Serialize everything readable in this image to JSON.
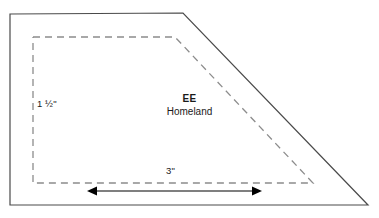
{
  "diagram": {
    "type": "technical-drawing",
    "canvas": {
      "width": 379,
      "height": 218,
      "background": "#ffffff"
    },
    "labels": {
      "height_dimension": "1 ½\"",
      "width_dimension": "3\"",
      "block_code": "EE",
      "block_name": "Homeland"
    },
    "colors": {
      "outline": "#4a4a4a",
      "dashed": "#8c8c8c",
      "arrow": "#000000",
      "text": "#1a1a1a"
    },
    "shapes": {
      "outer_trapezoid": {
        "stroke": "#4a4a4a",
        "stroke_width": 1.2,
        "fill": "none",
        "points": "10,14 183,13 368,205 10,205"
      },
      "inner_trapezoid_dashed": {
        "stroke": "#8c8c8c",
        "stroke_width": 1.3,
        "dash": "7,5",
        "fill": "none",
        "points": "33,37 175,37 313,183 33,183"
      },
      "dimension_arrow": {
        "stroke": "#000000",
        "stroke_width": 1.1,
        "x1": 87,
        "x2": 262,
        "y": 191,
        "head_length": 9,
        "head_half_width": 4.5
      }
    }
  }
}
